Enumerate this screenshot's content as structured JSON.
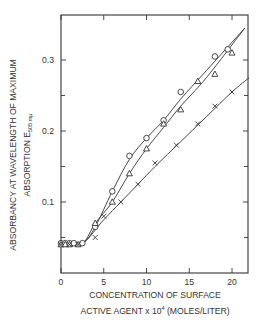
{
  "chart_data": {
    "type": "line",
    "title": "",
    "xlabel_line1": "CONCENTRATION OF SURFACE",
    "xlabel_line2": "ACTIVE AGENT x 10",
    "xlabel_exp": "4",
    "xlabel_unit": "(MOLES/LITER)",
    "ylabel_line1": "ABSORBANCY AT WAVELENGTH OF MAXIMUM",
    "ylabel_line2": "ABSORPTION  E",
    "ylabel_sub": "505 mμ",
    "xlim": [
      0,
      22
    ],
    "ylim": [
      0,
      0.35
    ],
    "xticks": [
      0,
      5,
      10,
      15,
      20
    ],
    "xtick_labels": [
      "0",
      "5",
      "10",
      "15",
      "20"
    ],
    "yticks": [
      0.1,
      0.2,
      0.3
    ],
    "ytick_labels": [
      "0.1",
      "0.2",
      "0.3"
    ],
    "grid": false,
    "legend": "none",
    "series": [
      {
        "name": "circles",
        "marker": "circle",
        "x": [
          0,
          0.5,
          1,
          1.5,
          2.5,
          4,
          6,
          8,
          10,
          12,
          14,
          18,
          19.5
        ],
        "y": [
          0.042,
          0.042,
          0.042,
          0.042,
          0.042,
          0.065,
          0.115,
          0.165,
          0.19,
          0.215,
          0.255,
          0.305,
          0.315
        ]
      },
      {
        "name": "triangles",
        "marker": "triangle",
        "x": [
          0,
          0.5,
          1,
          2,
          4,
          6,
          8,
          10,
          12,
          14,
          16,
          18,
          20
        ],
        "y": [
          0.04,
          0.04,
          0.04,
          0.04,
          0.07,
          0.1,
          0.14,
          0.175,
          0.21,
          0.23,
          0.27,
          0.28,
          0.31
        ]
      },
      {
        "name": "crosses",
        "marker": "cross",
        "x": [
          0,
          1,
          2,
          4,
          5,
          7,
          9,
          11,
          13.5,
          16,
          18,
          20
        ],
        "y": [
          0.04,
          0.04,
          0.04,
          0.05,
          0.08,
          0.1,
          0.125,
          0.155,
          0.18,
          0.21,
          0.235,
          0.255
        ]
      }
    ],
    "fit_lines": [
      {
        "name": "circle-curve",
        "x": [
          0,
          2.5,
          4,
          6,
          8,
          10,
          12,
          14,
          17,
          21.5
        ],
        "y": [
          0.042,
          0.042,
          0.065,
          0.115,
          0.16,
          0.19,
          0.215,
          0.245,
          0.285,
          0.345
        ]
      },
      {
        "name": "triangle-curve",
        "x": [
          0,
          2.5,
          4,
          6,
          8,
          10,
          12,
          14,
          17,
          21.5
        ],
        "y": [
          0.04,
          0.042,
          0.07,
          0.1,
          0.14,
          0.175,
          0.205,
          0.235,
          0.275,
          0.345
        ]
      },
      {
        "name": "cross-curve",
        "x": [
          0,
          2.5,
          5,
          7,
          9,
          11,
          14,
          17,
          20,
          22
        ],
        "y": [
          0.04,
          0.042,
          0.075,
          0.1,
          0.125,
          0.15,
          0.185,
          0.22,
          0.255,
          0.275
        ]
      }
    ]
  }
}
